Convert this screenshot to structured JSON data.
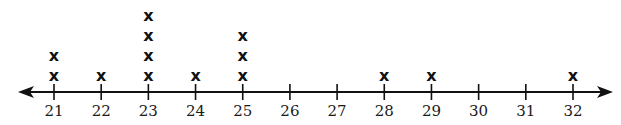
{
  "chart_data": {
    "type": "dot_plot",
    "title": "",
    "xlabel": "",
    "ylabel": "",
    "marker": "x",
    "axis": {
      "min": 21,
      "max": 32,
      "step": 1,
      "arrows": "both",
      "tick_labels": [
        "21",
        "22",
        "23",
        "24",
        "25",
        "26",
        "27",
        "28",
        "29",
        "30",
        "31",
        "32"
      ]
    },
    "categories": [
      21,
      22,
      23,
      24,
      25,
      26,
      27,
      28,
      29,
      30,
      31,
      32
    ],
    "values": [
      2,
      1,
      4,
      1,
      3,
      0,
      0,
      1,
      1,
      0,
      0,
      1
    ],
    "data_points": [
      21,
      21,
      22,
      23,
      23,
      23,
      23,
      24,
      25,
      25,
      25,
      28,
      29,
      32
    ],
    "total_count": 14,
    "grid": false,
    "colors": {
      "axis": "#111111",
      "marker": "#111111",
      "label": "#1a1a1a",
      "background": "#ffffff"
    }
  }
}
